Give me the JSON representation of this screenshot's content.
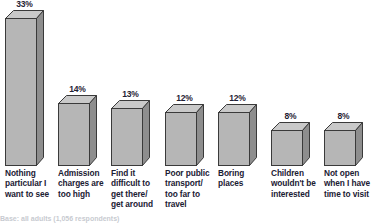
{
  "chart_data": {
    "type": "bar",
    "title": "",
    "subtitle": "",
    "xlabel": "",
    "ylabel": "",
    "ylim": [
      0,
      35
    ],
    "grid": false,
    "legend": "none",
    "value_suffix": "%",
    "three_d": true,
    "categories": [
      "Nothing particular I want to see",
      "Admission charges are too high",
      "Find it difficult to get there/ get around",
      "Poor public transport/ too far to travel",
      "Boring places",
      "Children wouldn't be interested",
      "Not open when I have time to visit"
    ],
    "values": [
      33,
      14,
      13,
      12,
      12,
      8,
      8
    ],
    "value_labels": [
      "33%",
      "14%",
      "13%",
      "12%",
      "12%",
      "8%",
      "8%"
    ],
    "category_lines": [
      [
        "Nothing",
        "particular I",
        "want to see"
      ],
      [
        "Admission",
        "charges are",
        "too high"
      ],
      [
        "Find it",
        "difficult to",
        "get there/",
        "get around"
      ],
      [
        "Poor public",
        "transport/",
        "too far to",
        "travel"
      ],
      [
        "Boring",
        "places"
      ],
      [
        "Children",
        "wouldn't be",
        "interested"
      ],
      [
        "Not open",
        "when I have",
        "time to visit"
      ]
    ]
  },
  "style": {
    "bar_face_color": "#b6b6b6",
    "bar_side_color": "#8e8e8e",
    "bar_top_color": "#c9c9c9",
    "bar_outline_color": "#3a3a3a",
    "label_color": "#1b2033",
    "value_color": "#1f2233",
    "background_color": "#ffffff"
  },
  "footnote": {
    "text": "Base: all adults (1,056 respondents)"
  }
}
